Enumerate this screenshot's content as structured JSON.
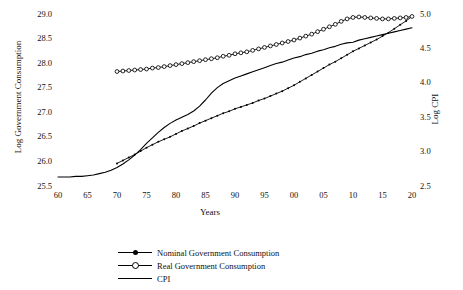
{
  "chart_data": {
    "type": "line",
    "title": "",
    "xlabel": "Years",
    "ylabel": "Log Government Consumption",
    "y2label": "Log CPI",
    "grid": false,
    "legend_position": "bottom",
    "xlim": [
      1960,
      2020
    ],
    "ylim": [
      25.5,
      29.0
    ],
    "y2lim": [
      2.5,
      5.0
    ],
    "xticks": [
      "60",
      "65",
      "70",
      "75",
      "80",
      "85",
      "90",
      "95",
      "00",
      "05",
      "10",
      "15",
      "20"
    ],
    "xtick_values": [
      1960,
      1965,
      1970,
      1975,
      1980,
      1985,
      1990,
      1995,
      2000,
      2005,
      2010,
      2015,
      2020
    ],
    "yticks_left": [
      "29.0",
      "28.5",
      "28.0",
      "27.5",
      "27.0",
      "26.5",
      "26.0",
      "25.5"
    ],
    "ytick_left_values": [
      29.0,
      28.5,
      28.0,
      27.5,
      27.0,
      26.5,
      26.0,
      25.5
    ],
    "yticks_right": [
      "5.0",
      "4.5",
      "4.0",
      "3.5",
      "3.0",
      "2.5"
    ],
    "ytick_right_values": [
      5.0,
      4.5,
      4.0,
      3.5,
      3.0,
      2.5
    ],
    "colors": {
      "line": "#000000",
      "background": "#ffffff"
    },
    "series": [
      {
        "name": "Nominal Government Consumption",
        "axis": "left",
        "marker": "filled-dot",
        "x": [
          1970,
          1971,
          1972,
          1973,
          1974,
          1975,
          1976,
          1977,
          1978,
          1979,
          1980,
          1981,
          1982,
          1983,
          1984,
          1985,
          1986,
          1987,
          1988,
          1989,
          1990,
          1991,
          1992,
          1993,
          1994,
          1995,
          1996,
          1997,
          1998,
          1999,
          2000,
          2001,
          2002,
          2003,
          2004,
          2005,
          2006,
          2007,
          2008,
          2009,
          2010,
          2011,
          2012,
          2013,
          2014,
          2015,
          2016,
          2017,
          2018,
          2019,
          2020
        ],
        "values": [
          25.96,
          26.02,
          26.08,
          26.14,
          26.21,
          26.28,
          26.34,
          26.4,
          26.45,
          26.5,
          26.56,
          26.62,
          26.67,
          26.72,
          26.78,
          26.83,
          26.88,
          26.93,
          26.98,
          27.02,
          27.07,
          27.11,
          27.15,
          27.19,
          27.24,
          27.28,
          27.33,
          27.38,
          27.43,
          27.49,
          27.55,
          27.62,
          27.69,
          27.76,
          27.83,
          27.9,
          27.97,
          28.03,
          28.1,
          28.17,
          28.24,
          28.3,
          28.36,
          28.42,
          28.48,
          28.55,
          28.62,
          28.7,
          28.78,
          28.86,
          28.95
        ]
      },
      {
        "name": "Real Government Consumption",
        "axis": "left",
        "marker": "open-circle",
        "x": [
          1970,
          1971,
          1972,
          1973,
          1974,
          1975,
          1976,
          1977,
          1978,
          1979,
          1980,
          1981,
          1982,
          1983,
          1984,
          1985,
          1986,
          1987,
          1988,
          1989,
          1990,
          1991,
          1992,
          1993,
          1994,
          1995,
          1996,
          1997,
          1998,
          1999,
          2000,
          2001,
          2002,
          2003,
          2004,
          2005,
          2006,
          2007,
          2008,
          2009,
          2010,
          2011,
          2012,
          2013,
          2014,
          2015,
          2016,
          2017,
          2018,
          2019,
          2020
        ],
        "values": [
          27.83,
          27.84,
          27.85,
          27.86,
          27.87,
          27.88,
          27.9,
          27.91,
          27.93,
          27.95,
          27.97,
          27.99,
          28.01,
          28.03,
          28.05,
          28.07,
          28.09,
          28.11,
          28.14,
          28.16,
          28.19,
          28.21,
          28.23,
          28.26,
          28.29,
          28.32,
          28.35,
          28.38,
          28.41,
          28.44,
          28.47,
          28.51,
          28.55,
          28.59,
          28.64,
          28.69,
          28.74,
          28.79,
          28.85,
          28.9,
          28.93,
          28.94,
          28.93,
          28.92,
          28.91,
          28.9,
          28.9,
          28.91,
          28.92,
          28.93,
          28.95
        ]
      },
      {
        "name": "CPI",
        "axis": "right",
        "marker": "none",
        "x": [
          1960,
          1961,
          1962,
          1963,
          1964,
          1965,
          1966,
          1967,
          1968,
          1969,
          1970,
          1971,
          1972,
          1973,
          1974,
          1975,
          1976,
          1977,
          1978,
          1979,
          1980,
          1981,
          1982,
          1983,
          1984,
          1985,
          1986,
          1987,
          1988,
          1989,
          1990,
          1991,
          1992,
          1993,
          1994,
          1995,
          1996,
          1997,
          1998,
          1999,
          2000,
          2001,
          2002,
          2003,
          2004,
          2005,
          2006,
          2007,
          2008,
          2009,
          2010,
          2011,
          2012,
          2013,
          2014,
          2015,
          2016,
          2017,
          2018,
          2019,
          2020
        ],
        "values": [
          2.63,
          2.63,
          2.63,
          2.64,
          2.64,
          2.65,
          2.66,
          2.68,
          2.7,
          2.73,
          2.77,
          2.82,
          2.88,
          2.95,
          3.03,
          3.12,
          3.2,
          3.28,
          3.35,
          3.41,
          3.46,
          3.5,
          3.54,
          3.59,
          3.66,
          3.75,
          3.85,
          3.93,
          3.99,
          4.03,
          4.07,
          4.1,
          4.13,
          4.16,
          4.19,
          4.22,
          4.25,
          4.28,
          4.3,
          4.33,
          4.36,
          4.38,
          4.41,
          4.43,
          4.46,
          4.48,
          4.51,
          4.53,
          4.56,
          4.58,
          4.59,
          4.62,
          4.64,
          4.66,
          4.68,
          4.7,
          4.72,
          4.74,
          4.76,
          4.78,
          4.8
        ]
      }
    ]
  },
  "legend": {
    "items": [
      {
        "label": "Nominal Government Consumption",
        "marker": "filled-dot"
      },
      {
        "label": "Real Government Consumption",
        "marker": "open-circle"
      },
      {
        "label": "CPI",
        "marker": "none"
      }
    ]
  }
}
